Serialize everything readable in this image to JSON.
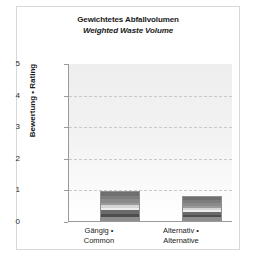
{
  "chart_data": {
    "type": "bar",
    "title": "Gewichtetes Abfallvolumen",
    "subtitle": "Weighted Waste Volume",
    "xlabel": "",
    "ylabel": "Bewertung • Rating",
    "ylim": [
      0,
      5
    ],
    "yticks": [
      "0",
      "1",
      "2",
      "3",
      "4",
      "5"
    ],
    "gridlines": [
      1,
      2,
      3,
      4
    ],
    "grid": true,
    "legend": "none",
    "categories": [
      "Gängig • Common",
      "Alternativ • Alternative"
    ],
    "category_lines": [
      [
        "Gängig •",
        "Common"
      ],
      [
        "Alternativ •",
        "Alternative"
      ]
    ],
    "values": [
      0.95,
      0.78
    ],
    "series": [
      {
        "name": "Gewichtetes Abfallvolumen",
        "values": [
          0.95,
          0.78
        ]
      }
    ]
  },
  "figure": {
    "title_de": "Gewichtetes Abfallvolumen",
    "title_en": "Weighted Waste Volume",
    "axis": {
      "y_title": "Bewertung • Rating",
      "tick_5": "5",
      "tick_4": "4",
      "tick_3": "3",
      "tick_2": "2",
      "tick_1": "1",
      "tick_0": "0"
    },
    "bars": [
      {
        "label_line1": "Gängig •",
        "label_line2": "Common",
        "value": 0.95
      },
      {
        "label_line1": "Alternativ •",
        "label_line2": "Alternative",
        "value": 0.78
      }
    ],
    "colors": {
      "plot_background": "#f0f0f0",
      "axis_line": "#9a9a9a",
      "gridline": "#c9c9c9",
      "bar_dark": "#4d4d4d",
      "bar_mid": "#8a8a8a",
      "bar_light": "#ededed",
      "frame": "#d8d8d8",
      "text": "#1a1a1a"
    }
  }
}
